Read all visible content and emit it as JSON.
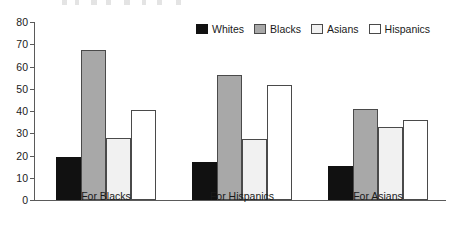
{
  "chart_data": {
    "type": "bar",
    "title": "",
    "subtitle": "",
    "xlabel": "",
    "ylabel": "",
    "categories": [
      "For Blacks",
      "For Hispanics",
      "For Asians"
    ],
    "series": [
      {
        "name": "Whites",
        "values": [
          19.5,
          17.0,
          15.5
        ],
        "fill": "#111111",
        "stroke": "#111111"
      },
      {
        "name": "Blacks",
        "values": [
          67.5,
          56.0,
          41.0
        ],
        "fill": "#a8a8a8",
        "stroke": "#4a4a4a"
      },
      {
        "name": "Asians",
        "values": [
          28.0,
          27.5,
          33.0
        ],
        "fill": "#f1f1f1",
        "stroke": "#4a4a4a"
      },
      {
        "name": "Hispanics",
        "values": [
          40.5,
          51.5,
          36.0
        ],
        "fill": "#ffffff",
        "stroke": "#4a4a4a"
      }
    ],
    "ylim": [
      0,
      80
    ],
    "yticks": [
      0,
      10,
      20,
      30,
      40,
      50,
      60,
      70,
      80
    ],
    "ytick_labels": [
      "0",
      "10",
      "20",
      "30",
      "40",
      "50",
      "60",
      "70",
      "80"
    ],
    "grid": false,
    "legend_position": "top-right",
    "legend_entries": [
      "Whites",
      "Blacks",
      "Asians",
      "Hispanics"
    ]
  },
  "axis": {
    "line_color": "#5a5a5a"
  },
  "text": {
    "tick_color": "#1a1a1a"
  }
}
